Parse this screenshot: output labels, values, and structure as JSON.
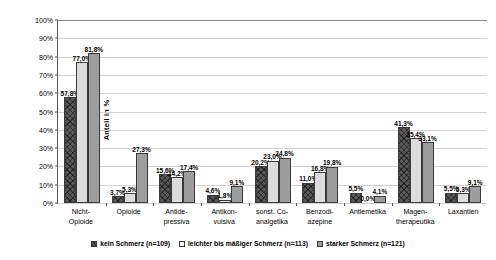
{
  "chart_data": {
    "type": "bar",
    "title": "",
    "subtitle": "",
    "xlabel": "",
    "ylabel": "Anteil in %",
    "ylim": [
      0,
      100
    ],
    "grid": true,
    "legend_position": "bottom",
    "value_suffix": "%",
    "decimal_separator": ",",
    "categories": [
      "Nicht-\nOpioide",
      "Opioide",
      "Antide-\npressiva",
      "Antikon-\nvulsiva",
      "sonst. Co-\nanalgetika",
      "Benzodi-\nazepine",
      "Antiemetika",
      "Magen-\ntherapeutika",
      "Laxantien"
    ],
    "ytick_labels": [
      "0%",
      "10%",
      "20%",
      "30%",
      "40%",
      "50%",
      "60%",
      "70%",
      "80%",
      "90%",
      "100%"
    ],
    "ytick_values": [
      0,
      10,
      20,
      30,
      40,
      50,
      60,
      70,
      80,
      90,
      100
    ],
    "series": [
      {
        "name": "kein Schmerz (n=109)",
        "color": "#595959",
        "pattern": "crosshatch",
        "values": [
          57.8,
          3.7,
          15.6,
          4.6,
          20.2,
          11.0,
          5.5,
          41.3,
          5.5
        ],
        "labels": [
          "57,8%",
          "3,7%",
          "15,6%",
          "4,6%",
          "20,2%",
          "11,0%",
          "5,5%",
          "41,3%",
          "5,5%"
        ]
      },
      {
        "name": "leichter bis mäßiger Schmerz (n=113)",
        "color": "#dcdcdc",
        "pattern": "solid-light",
        "values": [
          77.0,
          5.3,
          14.2,
          1.8,
          23.0,
          16.8,
          0.0,
          35.4,
          5.3
        ],
        "labels": [
          "77,0%",
          "5,3%",
          "14,2%",
          "1,8%",
          "23,0%",
          "16,8%",
          "0,0%",
          "35,4%",
          "5,3%"
        ]
      },
      {
        "name": "starker Schmerz (n=121)",
        "color": "#9d9d9d",
        "pattern": "solid-mid",
        "values": [
          81.8,
          27.3,
          17.4,
          9.1,
          24.8,
          19.8,
          4.1,
          33.1,
          9.1
        ],
        "labels": [
          "81,8%",
          "27,3%",
          "17,4%",
          "9,1%",
          "24,8%",
          "19,8%",
          "4,1%",
          "33,1%",
          "9,1%"
        ]
      }
    ]
  },
  "axis": {
    "y_title": "Anteil in %"
  },
  "legend": {
    "items": [
      {
        "label": "kein Schmerz (n=109)"
      },
      {
        "label": "leichter bis mäßiger Schmerz (n=113)"
      },
      {
        "label": "starker Schmerz (n=121)"
      }
    ]
  }
}
